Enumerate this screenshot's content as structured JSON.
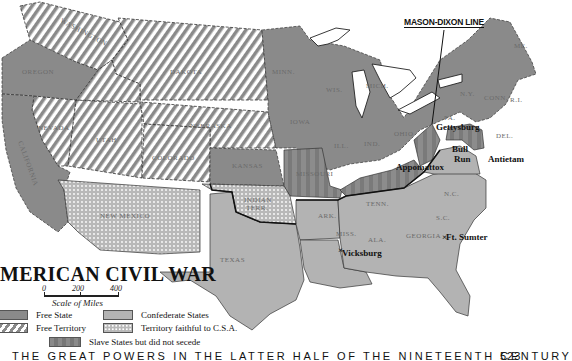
{
  "map": {
    "title": "AMERICAN CIVIL WAR",
    "title_visible": "MERICAN CIVIL WAR",
    "scale": {
      "ticks": [
        "0",
        "200",
        "400"
      ],
      "caption": "Scale of Miles"
    },
    "legend": [
      {
        "label": "Free State",
        "pattern": "solid-dark"
      },
      {
        "label": "Free Territory",
        "pattern": "diagonal-stripes"
      },
      {
        "label": "Confederate States",
        "pattern": "solid-light"
      },
      {
        "label": "Territory faithful to C.S.A.",
        "pattern": "dots"
      },
      {
        "label": "Slave States but did not secede",
        "pattern": "vertical-stripes"
      }
    ],
    "annotation": "MASON-DIXON LINE",
    "places": {
      "battles": [
        "Gettysburg",
        "Bull Run",
        "Antietam",
        "Appomattox",
        "Vicksburg",
        "Ft. Sumter"
      ],
      "states_free": [
        "OREGON",
        "CALIFORNIA",
        "KANSAS",
        "MINN.",
        "IOWA",
        "WIS.",
        "MICH.",
        "ILL.",
        "IND.",
        "OHIO",
        "PA.",
        "N.Y.",
        "VT.",
        "N.H.",
        "ME.",
        "MASS.",
        "CONN.",
        "R.I.",
        "N.J."
      ],
      "territories_free": [
        "WASHINGTON",
        "DAKOTA",
        "NEBRASKA",
        "NEVADA",
        "UTAH",
        "COLORADO"
      ],
      "territories_csa": [
        "NEW MEXICO",
        "INDIAN TERR."
      ],
      "states_confederate": [
        "TEXAS",
        "ARK.",
        "LA.",
        "MISS.",
        "ALA.",
        "GA.",
        "FLA.",
        "TENN.",
        "N.C.",
        "S.C.",
        "VA."
      ],
      "states_slave_union": [
        "MISSOURI",
        "KY.",
        "W.VA.",
        "MD.",
        "DEL."
      ]
    },
    "colors": {
      "free": "#8a8a8a",
      "confederate": "#b3b3b3",
      "water": "#ffffff",
      "border": "#222222"
    }
  },
  "footer": {
    "running_head": "THE GREAT POWERS IN THE LATTER HALF OF THE NINETEENTH CENTURY",
    "page_number": "523"
  }
}
